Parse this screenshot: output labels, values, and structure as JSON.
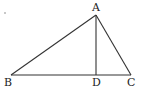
{
  "diagram": {
    "type": "triangle-with-altitude",
    "points": {
      "A": {
        "label": "A",
        "x": 96,
        "y": 15
      },
      "B": {
        "label": "B",
        "x": 11,
        "y": 75
      },
      "C": {
        "label": "C",
        "x": 131,
        "y": 75
      },
      "D": {
        "label": "D",
        "x": 96,
        "y": 75
      }
    },
    "segments": [
      "AB",
      "AC",
      "BC",
      "AD"
    ],
    "labels": {
      "A": "A",
      "B": "B",
      "C": "C",
      "D": "D"
    }
  }
}
